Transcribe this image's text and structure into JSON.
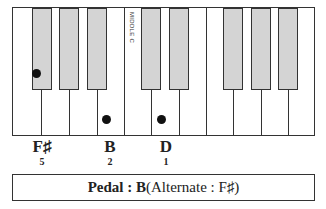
{
  "keyboard": {
    "middle_c_label": "MIDDLE C",
    "white_key_dividers_x": [
      28,
      56,
      84,
      111,
      138,
      166,
      193,
      220,
      248,
      275
    ],
    "black_keys": [
      {
        "left": 19,
        "width": 20
      },
      {
        "left": 46,
        "width": 20
      },
      {
        "left": 74,
        "width": 20
      },
      {
        "left": 128,
        "width": 20
      },
      {
        "left": 156,
        "width": 20
      },
      {
        "left": 210,
        "width": 20
      },
      {
        "left": 238,
        "width": 20
      },
      {
        "left": 265,
        "width": 20
      }
    ],
    "dots": [
      {
        "note": "F#",
        "x": 36,
        "y": 73
      },
      {
        "note": "B",
        "x": 106,
        "y": 119
      },
      {
        "note": "D",
        "x": 161,
        "y": 119
      }
    ]
  },
  "notes": [
    {
      "name": "F♯",
      "finger": "5",
      "x": 27
    },
    {
      "name": "B",
      "finger": "2",
      "x": 95
    },
    {
      "name": "D",
      "finger": "1",
      "x": 151
    }
  ],
  "pedal": {
    "label": "Pedal : B",
    "alternate": " (Alternate : F♯)"
  }
}
